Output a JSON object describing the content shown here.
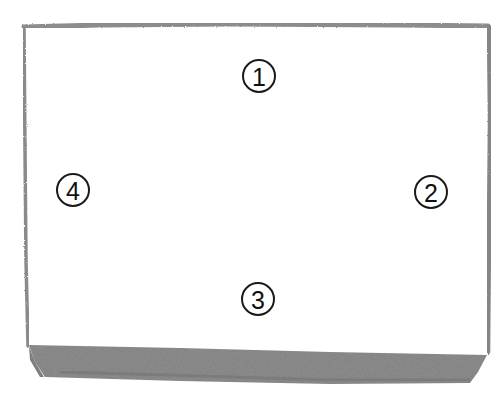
{
  "diagram": {
    "type": "hand-drawn box / tray sketch",
    "style": "grey watercolor-pencil outline, shaded bottom side",
    "colors": {
      "outline": "#8a8a8a",
      "bottom_shade": "#8f8f8f",
      "bottom_shade_dark": "#6e6e6e",
      "label_ink": "#111111",
      "background": "#ffffff"
    },
    "labels": [
      {
        "id": 1,
        "text": "1",
        "position": "top"
      },
      {
        "id": 2,
        "text": "2",
        "position": "right"
      },
      {
        "id": 3,
        "text": "3",
        "position": "bottom"
      },
      {
        "id": 4,
        "text": "4",
        "position": "left"
      }
    ]
  }
}
